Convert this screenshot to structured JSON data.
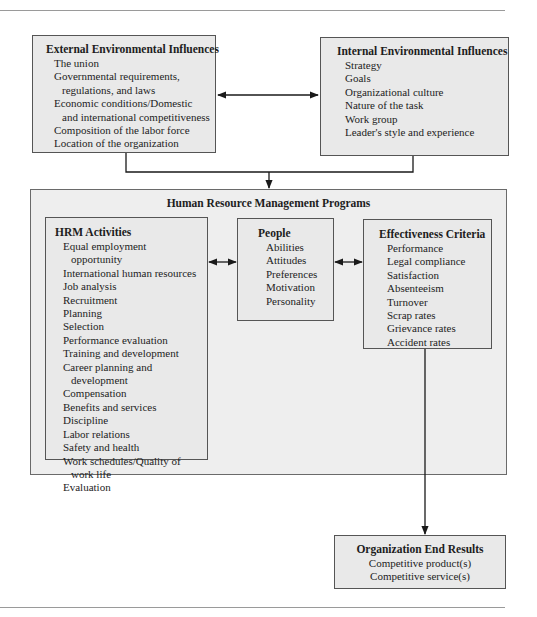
{
  "external": {
    "title": "External Environmental Influences",
    "items": [
      {
        "line1": "The union",
        "line2": null
      },
      {
        "line1": "Governmental requirements,",
        "line2": "regulations, and laws"
      },
      {
        "line1": "Economic conditions/Domestic",
        "line2": "and international competitiveness"
      },
      {
        "line1": "Composition of the labor force",
        "line2": null
      },
      {
        "line1": "Location of the organization",
        "line2": null
      }
    ]
  },
  "internal": {
    "title": "Internal Environmental Influences",
    "items": [
      "Strategy",
      "Goals",
      "Organizational culture",
      "Nature of the task",
      "Work group",
      "Leader's style and experience"
    ]
  },
  "programs": {
    "title": "Human Resource Management Programs",
    "hrm": {
      "title": "HRM Activities",
      "items": [
        {
          "line1": "Equal employment",
          "line2": "opportunity"
        },
        {
          "line1": "International human resources",
          "line2": null
        },
        {
          "line1": "Job analysis",
          "line2": null
        },
        {
          "line1": "Recruitment",
          "line2": null
        },
        {
          "line1": "Planning",
          "line2": null
        },
        {
          "line1": "Selection",
          "line2": null
        },
        {
          "line1": "Performance evaluation",
          "line2": null
        },
        {
          "line1": "Training and development",
          "line2": null
        },
        {
          "line1": "Career planning and",
          "line2": "development"
        },
        {
          "line1": "Compensation",
          "line2": null
        },
        {
          "line1": "Benefits and services",
          "line2": null
        },
        {
          "line1": "Discipline",
          "line2": null
        },
        {
          "line1": "Labor relations",
          "line2": null
        },
        {
          "line1": "Safety and health",
          "line2": null
        },
        {
          "line1": "Work schedules/Quality of",
          "line2": "work life"
        },
        {
          "line1": "Evaluation",
          "line2": null
        }
      ]
    },
    "people": {
      "title": "People",
      "items": [
        "Abilities",
        "Attitudes",
        "Preferences",
        "Motivation",
        "Personality"
      ]
    },
    "effectiveness": {
      "title": "Effectiveness Criteria",
      "items": [
        "Performance",
        "Legal compliance",
        "Satisfaction",
        "Absenteeism",
        "Turnover",
        "Scrap rates",
        "Grievance rates",
        "Accident rates"
      ]
    }
  },
  "end_results": {
    "title": "Organization End Results",
    "items": [
      "Competitive product(s)",
      "Competitive service(s)"
    ]
  },
  "colors": {
    "box_fill": "#e9e9e9",
    "border": "#555555",
    "line": "#1a1a1a"
  }
}
